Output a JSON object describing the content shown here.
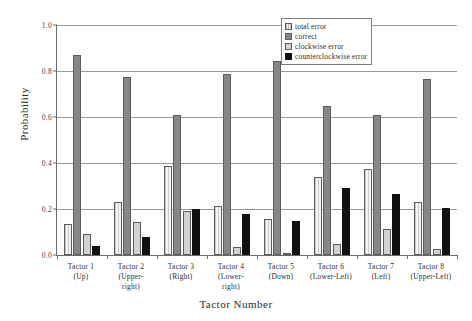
{
  "chart_data": {
    "type": "bar",
    "title": "",
    "xlabel": "Tactor Number",
    "ylabel": "Probability",
    "ylim": [
      0,
      1.0
    ],
    "yticks": [
      0.0,
      0.2,
      0.4,
      0.6,
      0.8,
      1.0
    ],
    "ytick_labels": [
      "0.0",
      "0.2",
      "0.4",
      "0.6",
      "0.8",
      "1.0"
    ],
    "grid": "horizontal",
    "legend_position": "top-right",
    "categories": [
      "Tactor 1\n(Up)",
      "Tactor 2\n(Upper-right)",
      "Tactor 3\n(Right)",
      "Tactor 4\n(Lower-right)",
      "Tactor 5\n(Down)",
      "Tactor 6\n(Lower-Left)",
      "Tactor 7\n(Left)",
      "Tactor 8\n(Upper-Left)"
    ],
    "category_lines": [
      [
        "Tactor 1",
        "(Up)"
      ],
      [
        "Tactor 2",
        "(Upper-",
        "right)"
      ],
      [
        "Tactor 3",
        "(Right)"
      ],
      [
        "Tactor 4",
        "(Lower-",
        "right)"
      ],
      [
        "Tactor 5",
        "(Down)"
      ],
      [
        "Tactor 6",
        "(Lower-Left)"
      ],
      [
        "Tactor 7",
        "(Left)"
      ],
      [
        "Tactor 8",
        "(Upper-Left)"
      ]
    ],
    "series": [
      {
        "name": "total error",
        "color": "#e8e8e8",
        "values": [
          0.135,
          0.23,
          0.385,
          0.215,
          0.155,
          0.34,
          0.375,
          0.23
        ]
      },
      {
        "name": "correct",
        "color": "#878787",
        "values": [
          0.87,
          0.775,
          0.61,
          0.785,
          0.845,
          0.65,
          0.61,
          0.765
        ]
      },
      {
        "name": "clockwise error",
        "color": "#d2d2d2",
        "values": [
          0.09,
          0.145,
          0.19,
          0.035,
          0.01,
          0.05,
          0.115,
          0.025
        ]
      },
      {
        "name": "counterclockwise error",
        "color": "#111111",
        "values": [
          0.04,
          0.08,
          0.2,
          0.18,
          0.148,
          0.29,
          0.265,
          0.205
        ]
      }
    ]
  },
  "legend": {
    "items": [
      {
        "label": "total error"
      },
      {
        "label": "correct"
      },
      {
        "label": "clockwise error"
      },
      {
        "label": "counterclockwise error"
      }
    ]
  }
}
